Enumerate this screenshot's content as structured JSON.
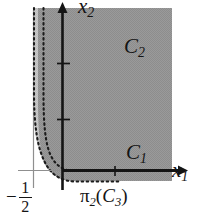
{
  "figure": {
    "kind": "mathematical-region-plot",
    "background_color": "#ffffff",
    "axes": {
      "x_axis_label": "x",
      "x_axis_subscript": "1",
      "y_axis_label": "x",
      "y_axis_subscript": "2",
      "axis_color": "#141414",
      "origin_px": {
        "x": 62,
        "y": 170
      }
    },
    "regions": [
      {
        "name": "C2",
        "label": "C",
        "subscript": "2",
        "fill_color": "#969696",
        "description": "upper shaded region"
      },
      {
        "name": "C1",
        "label": "C",
        "subscript": "1",
        "fill_color": "#969696",
        "description": "lower shaded region near x1 axis"
      },
      {
        "name": "C3-projection-band",
        "label": "π",
        "subscript": "2",
        "argument": "(C",
        "argument_subscript": "3",
        "fill_color": "#c4c4c4",
        "description": "light band between the two dashed curves"
      }
    ],
    "tick_labels": [
      {
        "id": "neg-one-half",
        "sign": "−",
        "numerator": "1",
        "denominator": "2",
        "axis": "x1",
        "text": "−1/2"
      }
    ],
    "annotations": {
      "c2_label": "C",
      "c2_sub": "2",
      "c1_label": "C",
      "c1_sub": "1",
      "x1_label": "x",
      "x1_sub": "1",
      "x2_label": "x",
      "x2_sub": "2",
      "pi_label": "π",
      "pi_sub": "2",
      "pi_open": "(",
      "pi_arg": "C",
      "pi_arg_sub": "3",
      "pi_close": ")",
      "minus_sign": "−",
      "frac_num": "1",
      "frac_den": "2"
    },
    "curves": [
      {
        "name": "inner-dashed-boundary",
        "style": "dashed",
        "color": "#1e1e1e",
        "description": "right dashed asymptotic curve bounding C2/C1 on the left"
      },
      {
        "name": "outer-dashed-boundary",
        "style": "dashed",
        "color": "#1e1e1e",
        "description": "left dashed asymptotic curve"
      },
      {
        "name": "asymptote-line",
        "style": "solid-thin",
        "color": "#8c8c8c",
        "description": "vertical line at x1 = -1/2"
      }
    ]
  }
}
